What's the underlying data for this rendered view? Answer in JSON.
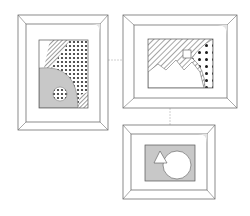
{
  "colors": {
    "frame_stroke": "#6e6e6e",
    "frame_fill": "#ffffff",
    "bevel_shade": "#e4e4e4",
    "art_gray": "#c8c8c8",
    "pattern_ink": "#3a3a3a",
    "connector": "#d0d0d0"
  },
  "frames": [
    {
      "id": "frame-left",
      "orientation": "portrait",
      "artwork": "hatched wedge, polka-dot band, gray quarter circle with dotted circle"
    },
    {
      "id": "frame-top-right",
      "orientation": "landscape",
      "artwork": "hatched sky, white mountains, small square, dotted corner"
    },
    {
      "id": "frame-bottom-right",
      "orientation": "landscape",
      "artwork": "gray field with white triangle and white circle"
    }
  ]
}
